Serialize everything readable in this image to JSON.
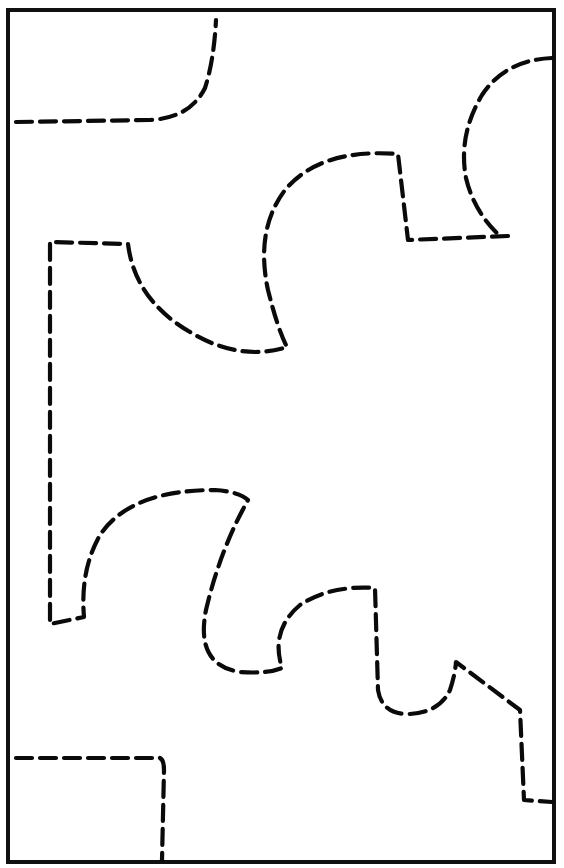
{
  "diagram": {
    "type": "dashed-cut-lines-on-sheet",
    "colors": {
      "background": "#ffffff",
      "frame": "#111111",
      "dash": "#0a0a0a"
    },
    "frame": {
      "x": 8,
      "y": 10,
      "w": 546,
      "h": 852
    },
    "shapes": [
      {
        "id": "top-left-corner-curve",
        "d": "M 16 122 L 150 120 Q 190 118 205 88 Q 214 60 216 20"
      },
      {
        "id": "top-right-semicircle",
        "d": "M 552 58 Q 505 60 482 95 Q 458 135 466 178 Q 474 212 500 236"
      },
      {
        "id": "upper-puzzle-path",
        "d": "M 508 236 L 408 240 L 398 154 Q 320 148 285 190 Q 255 230 268 290 Q 278 330 287 347 Q 240 362 190 332 Q 135 300 128 244 L 50 242 L 50 624 L 84 617 Q 80 570 100 535 Q 130 490 215 490 Q 240 492 248 500 Q 220 550 206 610 Q 195 665 240 672 Q 268 674 282 668 Q 270 630 300 605 Q 330 585 375 588 L 378 690 Q 382 715 410 714 Q 440 712 450 690 Q 455 675 456 662 L 520 710 L 524 800 L 552 802"
      },
      {
        "id": "bottom-left-corner",
        "d": "M 16 758 L 160 758 Q 164 760 164 770 L 162 860"
      }
    ]
  }
}
